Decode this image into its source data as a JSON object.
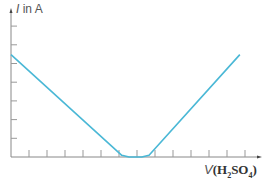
{
  "chart_data": {
    "type": "line",
    "title": "",
    "ylabel": "I in A",
    "ylabel_var": "I",
    "ylabel_unit": "in A",
    "xlabel": "V(H2SO4)",
    "xlabel_var": "V",
    "xlabel_formula_parts": [
      "(H",
      "2",
      "SO",
      "4",
      ")"
    ],
    "x_ticks_count": 13,
    "y_ticks_count": 7,
    "grid": false,
    "legend": null,
    "series": [
      {
        "name": "conductivity titration curve",
        "color": "#4ab8d6",
        "points": [
          [
            0,
            6
          ],
          [
            6.1,
            0.1
          ],
          [
            6.5,
            0
          ],
          [
            7.2,
            0
          ],
          [
            7.6,
            0.1
          ],
          [
            12.6,
            6
          ]
        ]
      }
    ],
    "xlim": [
      0,
      13.6
    ],
    "ylim": [
      0,
      8.5
    ]
  }
}
